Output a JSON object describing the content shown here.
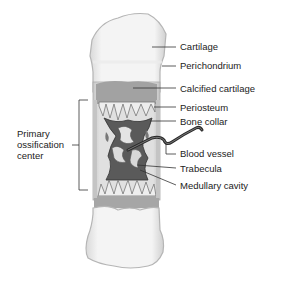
{
  "diagram": {
    "labels_right": [
      {
        "id": "cartilage",
        "text": "Cartilage"
      },
      {
        "id": "perichondrium",
        "text": "Perichondrium"
      },
      {
        "id": "calcified-cartilage",
        "text": "Calcified cartilage"
      },
      {
        "id": "periosteum",
        "text": "Periosteum"
      },
      {
        "id": "bone-collar",
        "text": "Bone collar"
      },
      {
        "id": "blood-vessel",
        "text": "Blood vessel"
      },
      {
        "id": "trabecula",
        "text": "Trabecula"
      },
      {
        "id": "medullary-cavity",
        "text": "Medullary cavity"
      }
    ],
    "labels_left": [
      {
        "id": "primary-ossification-center",
        "lines": [
          "Primary",
          "ossification",
          "center"
        ]
      }
    ],
    "colors": {
      "cartilage": "#f3f3f3",
      "cartilage_edge": "#bdbdbd",
      "calcified": "#9a9a9a",
      "bone_dark": "#4a4a4a",
      "trabecula": "#e6e6e6",
      "leader": "#333333"
    }
  }
}
